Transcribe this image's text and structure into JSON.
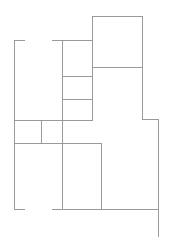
{
  "diagram": {
    "type": "floor-plan",
    "width": 173,
    "height": 237,
    "background": "#ffffff",
    "stroke_color": "#9a9a9a",
    "stroke_width": 1,
    "walls": [
      {
        "id": "top-left-stub",
        "x1": 14,
        "y1": 40,
        "x2": 24,
        "y2": 40
      },
      {
        "id": "left-outer-wall",
        "x1": 14,
        "y1": 40,
        "x2": 14,
        "y2": 209
      },
      {
        "id": "bottom-left-stub",
        "x1": 14,
        "y1": 209,
        "x2": 24,
        "y2": 209
      },
      {
        "id": "top-middle-wall",
        "x1": 52,
        "y1": 40,
        "x2": 92,
        "y2": 40
      },
      {
        "id": "center-vertical-wall",
        "x1": 62,
        "y1": 40,
        "x2": 62,
        "y2": 209
      },
      {
        "id": "tower-left-wall",
        "x1": 92,
        "y1": 16,
        "x2": 92,
        "y2": 120
      },
      {
        "id": "tower-top-wall",
        "x1": 92,
        "y1": 16,
        "x2": 142,
        "y2": 16
      },
      {
        "id": "tower-right-wall",
        "x1": 142,
        "y1": 16,
        "x2": 142,
        "y2": 119
      },
      {
        "id": "tower-divider",
        "x1": 92,
        "y1": 67,
        "x2": 142,
        "y2": 67
      },
      {
        "id": "closet-divider-1",
        "x1": 62,
        "y1": 76,
        "x2": 92,
        "y2": 76
      },
      {
        "id": "closet-divider-2",
        "x1": 62,
        "y1": 99,
        "x2": 92,
        "y2": 99
      },
      {
        "id": "mid-horizontal-wall",
        "x1": 14,
        "y1": 120,
        "x2": 92,
        "y2": 120
      },
      {
        "id": "small-room-divider",
        "x1": 41,
        "y1": 120,
        "x2": 41,
        "y2": 143
      },
      {
        "id": "lower-horizontal-wall",
        "x1": 14,
        "y1": 143,
        "x2": 101,
        "y2": 143
      },
      {
        "id": "lower-room-right-wall",
        "x1": 101,
        "y1": 143,
        "x2": 101,
        "y2": 209
      },
      {
        "id": "right-step-wall",
        "x1": 142,
        "y1": 119,
        "x2": 158,
        "y2": 119
      },
      {
        "id": "right-outer-wall",
        "x1": 158,
        "y1": 119,
        "x2": 158,
        "y2": 236
      },
      {
        "id": "bottom-main-wall",
        "x1": 52,
        "y1": 209,
        "x2": 158,
        "y2": 209
      }
    ]
  }
}
